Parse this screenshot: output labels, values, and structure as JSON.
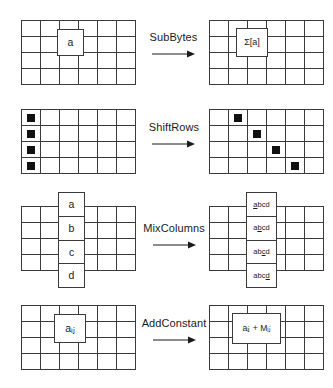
{
  "figure": {
    "grid": {
      "columns": 6,
      "rows": 4
    },
    "stroke_color": "#3a3a3a",
    "marker_color": "#111111"
  },
  "operations": [
    {
      "name": "subbytes",
      "label": "SubBytes",
      "arrow": "right-arrow",
      "input": {
        "kind": "single-cell",
        "cell_text": "a",
        "cell_row": 2,
        "cell_col": 3
      },
      "output": {
        "kind": "single-cell",
        "cell_text": "Σ[a]",
        "cell_row": 2,
        "cell_col": 3
      }
    },
    {
      "name": "shiftrows",
      "label": "ShiftRows",
      "arrow": "right-arrow",
      "input": {
        "kind": "markers",
        "marker_cells": [
          {
            "row": 1,
            "col": 1
          },
          {
            "row": 2,
            "col": 1
          },
          {
            "row": 3,
            "col": 1
          },
          {
            "row": 4,
            "col": 1
          }
        ]
      },
      "output": {
        "kind": "markers",
        "marker_cells": [
          {
            "row": 1,
            "col": 2
          },
          {
            "row": 2,
            "col": 3
          },
          {
            "row": 3,
            "col": 4
          },
          {
            "row": 4,
            "col": 5
          }
        ]
      }
    },
    {
      "name": "mixcolumns",
      "label": "MixColumns",
      "arrow": "right-arrow",
      "input": {
        "kind": "column",
        "column_index": 3,
        "cells": [
          "a",
          "b",
          "c",
          "d"
        ]
      },
      "output": {
        "kind": "column",
        "column_index": 3,
        "cells": [
          "abcd",
          "abcd",
          "abcd",
          "abcd"
        ],
        "cells_emphasis": [
          {
            "text": "abcd",
            "underlined_index": 0
          },
          {
            "text": "abcd",
            "underlined_index": 1
          },
          {
            "text": "abcd",
            "underlined_index": 2
          },
          {
            "text": "abcd",
            "underlined_index": 3
          }
        ]
      }
    },
    {
      "name": "addconstant",
      "label": "AddConstant",
      "arrow": "right-arrow",
      "input": {
        "kind": "single-cell",
        "cell_text": "aᵢⱼ",
        "cell_base": "a",
        "cell_sub": "ij",
        "cell_row": 2,
        "cell_col": 3
      },
      "output": {
        "kind": "single-cell",
        "cell_text": "aᵢⱼ + Mᵢⱼ",
        "cell_row": 2,
        "cell_col": 3
      }
    }
  ]
}
